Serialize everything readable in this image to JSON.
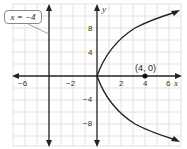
{
  "graph": {
    "x_axis_label": "x",
    "y_axis_label": "y",
    "x_tick_labels": [
      {
        "value": -6,
        "text": "−6"
      },
      {
        "value": -2,
        "text": "−2"
      },
      {
        "value": 2,
        "text": "2"
      },
      {
        "value": 4,
        "text": "4"
      },
      {
        "value": 6,
        "text": "6"
      }
    ],
    "y_tick_labels": [
      {
        "value": 8,
        "text": "8"
      },
      {
        "value": 4,
        "text": "4"
      },
      {
        "value": -4,
        "text": "−4"
      },
      {
        "value": -8,
        "text": "−8"
      }
    ],
    "directrix_label": "x = −4",
    "focus_label": "(4, 0)",
    "colors": {
      "grid": "#d9d9d9",
      "axis": "#222222",
      "curve": "#222222",
      "callout_border": "#888888"
    }
  }
}
